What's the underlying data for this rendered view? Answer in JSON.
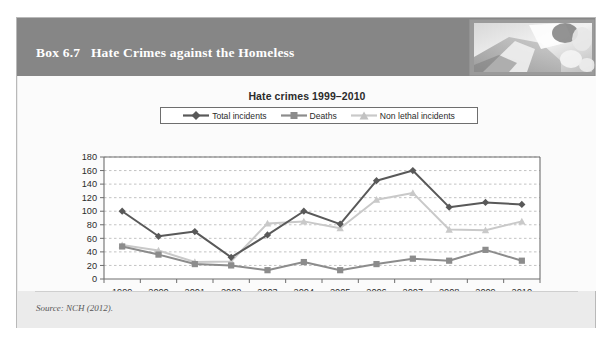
{
  "box": {
    "label": "Box 6.7",
    "title": "Hate Crimes against the Homeless",
    "header_title": "Box 6.7   Hate Crimes against the Homeless",
    "header_photo_alt": "grayscale-photo",
    "source": "Source: NCH (2012).",
    "colors": {
      "header_band": "#868686",
      "box_background": "#ebebeb",
      "panel_background": "#fbfbfb",
      "box_border": "#b9b9b9",
      "series_total": "#595959",
      "series_deaths": "#8c8c8c",
      "series_nonlethal": "#c9c9c9",
      "gridline": "#a9a9a9",
      "axis": "#6e6e6e"
    }
  },
  "chart_data": {
    "type": "line",
    "title": "Hate crimes 1999–2010",
    "xlabel": "",
    "ylabel": "",
    "categories": [
      "1999",
      "2000",
      "2001",
      "2002",
      "2003",
      "2004",
      "2005",
      "2006",
      "2007",
      "2008",
      "2009",
      "2010"
    ],
    "ylim": [
      0,
      180
    ],
    "yticks": [
      0,
      20,
      40,
      60,
      80,
      100,
      120,
      140,
      160,
      180
    ],
    "ytick_labels": [
      "0",
      "20",
      "40",
      "60",
      "80",
      "100",
      "120",
      "140",
      "160",
      "180"
    ],
    "grid": true,
    "grid_axis": "y",
    "legend_position": "top-center",
    "series": [
      {
        "name": "Total incidents",
        "marker": "diamond",
        "color": "#595959",
        "values": [
          100,
          63,
          70,
          32,
          65,
          100,
          81,
          145,
          160,
          106,
          113,
          110
        ]
      },
      {
        "name": "Deaths",
        "marker": "square",
        "color": "#8c8c8c",
        "values": [
          48,
          36,
          22,
          20,
          13,
          25,
          13,
          22,
          30,
          27,
          43,
          27
        ]
      },
      {
        "name": "Non lethal incidents",
        "marker": "triangle",
        "color": "#c9c9c9",
        "values": [
          50,
          42,
          25,
          26,
          82,
          85,
          75,
          117,
          127,
          73,
          72,
          85
        ]
      }
    ]
  }
}
